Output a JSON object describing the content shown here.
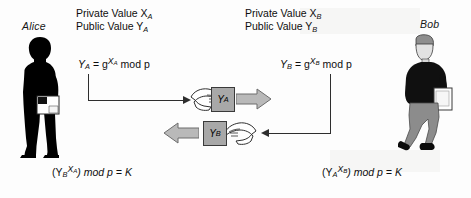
{
  "diagram": {
    "colors": {
      "packet_fill": "#a8a8a8",
      "block_arrow_fill": "#b9b9b9",
      "block_arrow_stroke": "#6d6d6d",
      "line": "#2e2e2e",
      "silhouette": "#000000",
      "bob_trousers": "#8c8c8c",
      "background": "#fdfdfd"
    },
    "alice": {
      "name": "Alice",
      "private_line": "Private Value X",
      "private_sub": "A",
      "public_line": "Public Value Y",
      "public_sub": "A",
      "formula_lhs": "Y",
      "formula_lhs_sub": "A",
      "formula_eq": "= g",
      "formula_exp": "X",
      "formula_exp_sub": "A",
      "formula_mod": "mod p",
      "secret_open": "(Y",
      "secret_base_sub": "B",
      "secret_exp": "X",
      "secret_exp_sub": "A",
      "secret_close": ") mod p = K"
    },
    "bob": {
      "name": "Bob",
      "private_line": "Private Value X",
      "private_sub": "B",
      "public_line": "Public Value Y",
      "public_sub": "B",
      "formula_lhs": "Y",
      "formula_lhs_sub": "B",
      "formula_eq": "= g",
      "formula_exp": "X",
      "formula_exp_sub": "B",
      "formula_mod": "mod p",
      "secret_open": "(Y",
      "secret_base_sub": "A",
      "secret_exp": "X",
      "secret_exp_sub": "B",
      "secret_close": ") mod p = K"
    },
    "packets": [
      {
        "label": "Y",
        "sub": "A",
        "direction": "left-to-right"
      },
      {
        "label": "Y",
        "sub": "B",
        "direction": "right-to-left"
      }
    ]
  }
}
